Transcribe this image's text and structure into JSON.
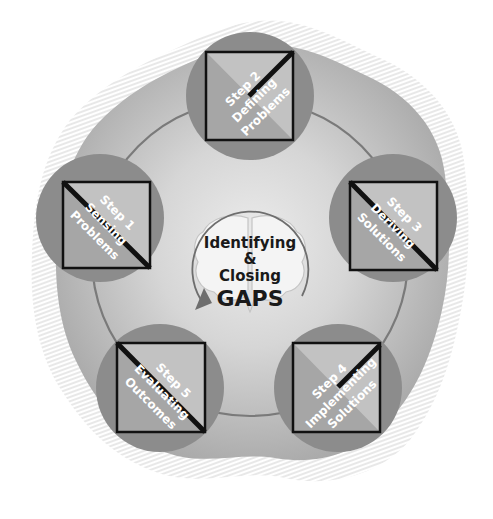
{
  "diagram": {
    "center": {
      "line1": "Identifying",
      "line2": "&",
      "line3": "Closing",
      "line4": "GAPS",
      "icon": "brain-icon",
      "arrow_icon": "cycle-arrow-icon"
    },
    "steps": [
      {
        "step": "Step 1",
        "line1": "Sensing",
        "line2": "Problems"
      },
      {
        "step": "Step 2",
        "line1": "Defining",
        "line2": "Problems"
      },
      {
        "step": "Step 3",
        "line1": "Deriving",
        "line2": "Solutions"
      },
      {
        "step": "Step 4",
        "line1": "Implementing",
        "line2": "Solutions"
      },
      {
        "step": "Step 5",
        "line1": "Evaluating",
        "line2": "Outcomes"
      }
    ],
    "colors": {
      "blob": "#b4b4b4",
      "blob_center": "#e6e6e6",
      "step_circle": "#8c8c8c",
      "square_light": "#c2c2c2",
      "square_dark": "#9a9a9a",
      "ring": "#7a7a7a",
      "outline": "#111111"
    }
  }
}
